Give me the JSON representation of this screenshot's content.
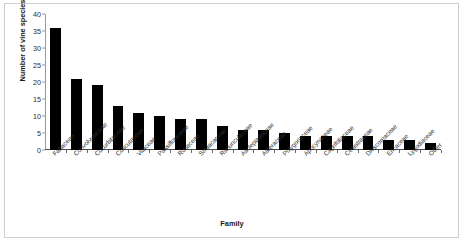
{
  "chart_data": {
    "type": "bar",
    "title": "",
    "xlabel": "Family",
    "ylabel": "Number of vine species",
    "ylim": [
      0,
      40
    ],
    "yticks": [
      0,
      5,
      10,
      15,
      20,
      25,
      30,
      35,
      40
    ],
    "grid": false,
    "legend": null,
    "bar_color": "#000000",
    "categories": [
      "Fabaceae",
      "Convolvulaceae",
      "Cucurbitaceae",
      "Cuscutaceae",
      "Vitaceae",
      "Passifloraceae",
      "Rosaceae",
      "Smilacaceae",
      "Ranunculaceae",
      "Asclepiadaceae",
      "Asteraceae",
      "Polygonaceae",
      "Apocynaceae",
      "Caprifoliaceae",
      "Celastraceae",
      "Dioscoreaceae",
      "Ericaceae",
      "Lygodiaceae",
      "Other"
    ],
    "values": [
      36,
      21,
      19,
      13,
      11,
      10,
      9,
      9,
      7,
      6,
      6,
      5,
      4,
      4,
      4,
      4,
      3,
      3,
      2
    ]
  },
  "axes": {
    "y_title": "Number of vine species",
    "x_title": "Family"
  }
}
